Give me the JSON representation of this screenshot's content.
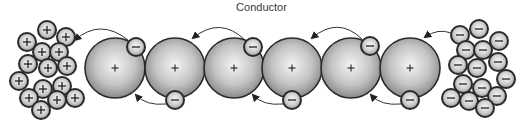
{
  "title": "Conductor",
  "colors": {
    "outline": "#2a2a2a",
    "atom_center": "#f2f2f2",
    "atom_edge": "#8c8c8c",
    "particle_center": "#f4f4f4",
    "particle_edge": "#9a9a9a",
    "arrow": "#333333",
    "symbol": "#222222"
  },
  "atoms": [
    {
      "label": "+",
      "cx": 115,
      "cy": 68
    },
    {
      "label": "+",
      "cx": 175,
      "cy": 68
    },
    {
      "label": "+",
      "cx": 234,
      "cy": 68
    },
    {
      "label": "+",
      "cx": 292,
      "cy": 68
    },
    {
      "label": "+",
      "cx": 351,
      "cy": 68
    },
    {
      "label": "+",
      "cx": 410,
      "cy": 68
    }
  ],
  "atom_radius": 30,
  "particle_radius": 9,
  "conductor_electrons": [
    {
      "label": "−",
      "cx": 136,
      "cy": 47
    },
    {
      "label": "−",
      "cx": 175,
      "cy": 100
    },
    {
      "label": "−",
      "cx": 253,
      "cy": 47
    },
    {
      "label": "−",
      "cx": 292,
      "cy": 100
    },
    {
      "label": "−",
      "cx": 370,
      "cy": 46
    },
    {
      "label": "−",
      "cx": 410,
      "cy": 100
    }
  ],
  "positive_cluster": {
    "label": "+",
    "particles": [
      [
        47,
        30
      ],
      [
        66,
        37
      ],
      [
        27,
        42
      ],
      [
        42,
        52
      ],
      [
        59,
        52
      ],
      [
        28,
        64
      ],
      [
        48,
        68
      ],
      [
        67,
        66
      ],
      [
        19,
        81
      ],
      [
        43,
        89
      ],
      [
        62,
        86
      ],
      [
        29,
        98
      ],
      [
        57,
        100
      ],
      [
        75,
        98
      ],
      [
        41,
        110
      ]
    ]
  },
  "negative_cluster": {
    "label": "−",
    "particles": [
      [
        460,
        35
      ],
      [
        479,
        29
      ],
      [
        499,
        41
      ],
      [
        466,
        50
      ],
      [
        483,
        50
      ],
      [
        458,
        65
      ],
      [
        477,
        68
      ],
      [
        498,
        62
      ],
      [
        506,
        79
      ],
      [
        463,
        84
      ],
      [
        482,
        88
      ],
      [
        451,
        98
      ],
      [
        469,
        101
      ],
      [
        497,
        96
      ],
      [
        485,
        108
      ]
    ]
  },
  "arrows": [
    {
      "direction": "top",
      "from": [
        128,
        40
      ],
      "ctrl": [
        100,
        18
      ],
      "to": [
        75,
        40
      ]
    },
    {
      "direction": "top",
      "from": [
        245,
        40
      ],
      "ctrl": [
        220,
        16
      ],
      "to": [
        193,
        38
      ]
    },
    {
      "direction": "top",
      "from": [
        362,
        39
      ],
      "ctrl": [
        338,
        16
      ],
      "to": [
        312,
        38
      ]
    },
    {
      "direction": "top",
      "from": [
        451,
        33
      ],
      "ctrl": [
        438,
        28
      ],
      "to": [
        425,
        37
      ]
    },
    {
      "direction": "bottom",
      "from": [
        166,
        104
      ],
      "ctrl": [
        146,
        106
      ],
      "to": [
        136,
        95
      ]
    },
    {
      "direction": "bottom",
      "from": [
        283,
        104
      ],
      "ctrl": [
        263,
        106
      ],
      "to": [
        253,
        95
      ]
    },
    {
      "direction": "bottom",
      "from": [
        401,
        104
      ],
      "ctrl": [
        381,
        106
      ],
      "to": [
        371,
        95
      ]
    }
  ]
}
